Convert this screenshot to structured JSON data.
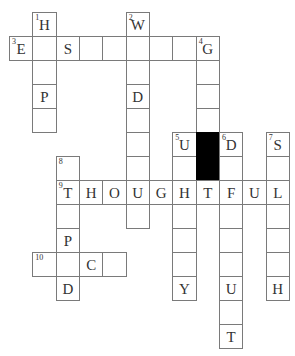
{
  "puzzle": {
    "type": "crossword",
    "cell_width": 23.33,
    "cell_height": 24,
    "origin_x": 9,
    "origin_y": 12,
    "colors": {
      "border": "#7a7a7a",
      "block": "#000000",
      "text": "#333333",
      "background": "#ffffff"
    },
    "cells": [
      {
        "r": 0,
        "c": 1,
        "num": "1",
        "letter": "H"
      },
      {
        "r": 0,
        "c": 5,
        "num": "2",
        "letter": "W"
      },
      {
        "r": 1,
        "c": 0,
        "num": "3",
        "letter": "E"
      },
      {
        "r": 1,
        "c": 1,
        "letter": ""
      },
      {
        "r": 1,
        "c": 2,
        "letter": "S"
      },
      {
        "r": 1,
        "c": 3,
        "letter": ""
      },
      {
        "r": 1,
        "c": 4,
        "letter": ""
      },
      {
        "r": 1,
        "c": 5,
        "letter": ""
      },
      {
        "r": 1,
        "c": 6,
        "letter": ""
      },
      {
        "r": 1,
        "c": 7,
        "letter": ""
      },
      {
        "r": 1,
        "c": 8,
        "num": "4",
        "letter": "G"
      },
      {
        "r": 2,
        "c": 1,
        "letter": ""
      },
      {
        "r": 2,
        "c": 5,
        "letter": ""
      },
      {
        "r": 2,
        "c": 8,
        "letter": ""
      },
      {
        "r": 3,
        "c": 1,
        "letter": "P"
      },
      {
        "r": 3,
        "c": 5,
        "letter": "D"
      },
      {
        "r": 3,
        "c": 8,
        "letter": ""
      },
      {
        "r": 4,
        "c": 1,
        "letter": ""
      },
      {
        "r": 4,
        "c": 5,
        "letter": ""
      },
      {
        "r": 4,
        "c": 8,
        "letter": ""
      },
      {
        "r": 5,
        "c": 5,
        "letter": ""
      },
      {
        "r": 5,
        "c": 7,
        "num": "5",
        "letter": "U"
      },
      {
        "r": 5,
        "c": 8,
        "black": true
      },
      {
        "r": 5,
        "c": 9,
        "num": "6",
        "letter": "D"
      },
      {
        "r": 5,
        "c": 11,
        "num": "7",
        "letter": "S"
      },
      {
        "r": 6,
        "c": 2,
        "num": "8",
        "letter": ""
      },
      {
        "r": 6,
        "c": 5,
        "letter": ""
      },
      {
        "r": 6,
        "c": 7,
        "letter": ""
      },
      {
        "r": 6,
        "c": 8,
        "black": true
      },
      {
        "r": 6,
        "c": 9,
        "letter": ""
      },
      {
        "r": 6,
        "c": 11,
        "letter": ""
      },
      {
        "r": 7,
        "c": 2,
        "num": "9",
        "letter": "T"
      },
      {
        "r": 7,
        "c": 3,
        "letter": "H"
      },
      {
        "r": 7,
        "c": 4,
        "letter": "O"
      },
      {
        "r": 7,
        "c": 5,
        "letter": "U"
      },
      {
        "r": 7,
        "c": 6,
        "letter": "G"
      },
      {
        "r": 7,
        "c": 7,
        "letter": "H"
      },
      {
        "r": 7,
        "c": 8,
        "letter": "T"
      },
      {
        "r": 7,
        "c": 9,
        "letter": "F"
      },
      {
        "r": 7,
        "c": 10,
        "letter": "U"
      },
      {
        "r": 7,
        "c": 11,
        "letter": "L"
      },
      {
        "r": 8,
        "c": 2,
        "letter": ""
      },
      {
        "r": 8,
        "c": 5,
        "letter": ""
      },
      {
        "r": 8,
        "c": 7,
        "letter": ""
      },
      {
        "r": 8,
        "c": 9,
        "letter": ""
      },
      {
        "r": 8,
        "c": 11,
        "letter": ""
      },
      {
        "r": 9,
        "c": 2,
        "letter": "P"
      },
      {
        "r": 9,
        "c": 7,
        "letter": ""
      },
      {
        "r": 9,
        "c": 9,
        "letter": ""
      },
      {
        "r": 9,
        "c": 11,
        "letter": ""
      },
      {
        "r": 10,
        "c": 1,
        "num": "10",
        "letter": ""
      },
      {
        "r": 10,
        "c": 2,
        "letter": ""
      },
      {
        "r": 10,
        "c": 3,
        "letter": "C"
      },
      {
        "r": 10,
        "c": 4,
        "letter": ""
      },
      {
        "r": 10,
        "c": 7,
        "letter": ""
      },
      {
        "r": 10,
        "c": 9,
        "letter": ""
      },
      {
        "r": 10,
        "c": 11,
        "letter": ""
      },
      {
        "r": 11,
        "c": 2,
        "letter": "D"
      },
      {
        "r": 11,
        "c": 7,
        "letter": "Y"
      },
      {
        "r": 11,
        "c": 9,
        "letter": "U"
      },
      {
        "r": 11,
        "c": 11,
        "letter": "H"
      },
      {
        "r": 12,
        "c": 9,
        "letter": ""
      },
      {
        "r": 13,
        "c": 9,
        "letter": "T"
      }
    ]
  }
}
